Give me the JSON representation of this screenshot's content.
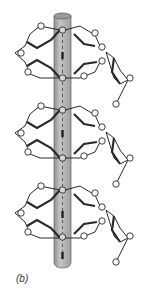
{
  "figure": {
    "label": "(b)",
    "colors": {
      "background": "#ffffff",
      "rod_fill": "#b4b4b4",
      "rod_edge": "#6e6e6e",
      "rod_top": "#9a9a9a",
      "line": "#2a2a2a",
      "oxygen_fill": "#ffffff"
    },
    "rod": {
      "x": 54,
      "width": 17,
      "top": 16,
      "bottom": 268
    },
    "ring_levels": [
      {
        "top_o_y": 30,
        "bottom_o_y": 78
      },
      {
        "top_o_y": 110,
        "bottom_o_y": 158
      },
      {
        "top_o_y": 190,
        "bottom_o_y": 237
      }
    ],
    "side_chain_segments": 3
  }
}
